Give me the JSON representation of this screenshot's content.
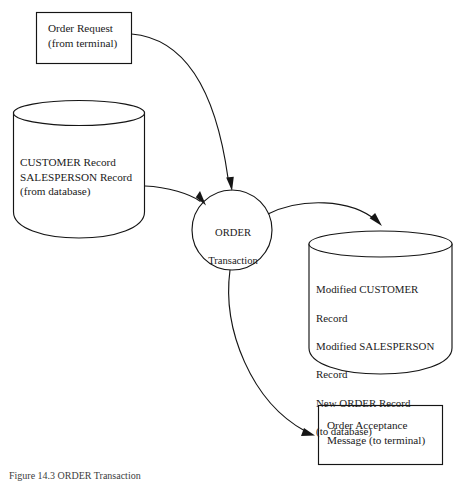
{
  "figure": {
    "caption": "Figure 14.3  ORDER Transaction",
    "type": "data-flow-diagram",
    "background_color": "#ffffff",
    "stroke_color": "#151515"
  },
  "nodes": {
    "order_request": {
      "kind": "terminal-box",
      "label": "Order Request\n(from terminal)"
    },
    "customer_store": {
      "kind": "data-store-cylinder",
      "label": "CUSTOMER Record\nSALESPERSON Record\n(from database)"
    },
    "process": {
      "kind": "process-circle",
      "name": "ORDER",
      "subtitle": "Transaction"
    },
    "output_store": {
      "kind": "data-store-cylinder",
      "lines": [
        "Modified CUSTOMER",
        "Record",
        "Modified SALESPERSON",
        "Record",
        "New ORDER Record",
        "(to database)"
      ]
    },
    "acceptance_message": {
      "kind": "terminal-box",
      "label": "Order Acceptance\nMessage (to terminal)"
    }
  },
  "flows": [
    {
      "name": "request-to-process",
      "from": "order_request",
      "to": "process",
      "label": ""
    },
    {
      "name": "store-to-process",
      "from": "customer_store",
      "to": "process",
      "label": ""
    },
    {
      "name": "process-to-store",
      "from": "process",
      "to": "output_store",
      "label": ""
    },
    {
      "name": "process-to-message",
      "from": "process",
      "to": "acceptance_message",
      "label": ""
    }
  ]
}
